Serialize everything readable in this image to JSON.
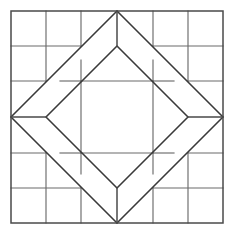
{
  "figure": {
    "type": "geometric-line-diagram",
    "caption": "",
    "background_color": "#ffffff",
    "line_color": "#3a3a3a",
    "grid_color": "#6b6b6b",
    "canvas": {
      "width": 237,
      "height": 235
    }
  },
  "geometry": {
    "outer_square": {
      "name": "outer-border-square",
      "x0": 11,
      "y0": 11,
      "x1": 223,
      "y1": 223
    },
    "grid": {
      "name": "six-by-six-grid",
      "columns": 6,
      "rows": 6,
      "x_positions": [
        11,
        46,
        81,
        117,
        153,
        188,
        223
      ],
      "y_positions": [
        11,
        46,
        81,
        117,
        153,
        188,
        223
      ]
    },
    "outer_diamond": {
      "name": "large-star-diamond",
      "points": [
        [
          117,
          11
        ],
        [
          223,
          117
        ],
        [
          117,
          223
        ],
        [
          11,
          117
        ]
      ]
    },
    "inner_diamond": {
      "name": "inner-diamond",
      "points": [
        [
          117,
          46
        ],
        [
          188,
          117
        ],
        [
          117,
          188
        ],
        [
          46,
          117
        ]
      ]
    },
    "center_square": {
      "name": "center-square-patch",
      "x0": 81,
      "y0": 81,
      "x1": 153,
      "y1": 153
    },
    "stems": [
      {
        "name": "stem-top",
        "from": [
          117,
          11
        ],
        "to": [
          117,
          46
        ]
      },
      {
        "name": "stem-left",
        "from": [
          11,
          117
        ],
        "to": [
          46,
          117
        ]
      },
      {
        "name": "stem-right",
        "from": [
          223,
          117
        ],
        "to": [
          188,
          117
        ]
      },
      {
        "name": "stem-bottom",
        "from": [
          117,
          223
        ],
        "to": [
          117,
          188
        ]
      }
    ],
    "corner_diagonals": [
      {
        "name": "diagonal-top-left",
        "from": [
          11,
          117
        ],
        "to": [
          117,
          11
        ]
      },
      {
        "name": "diagonal-top-right",
        "from": [
          117,
          11
        ],
        "to": [
          223,
          117
        ]
      },
      {
        "name": "diagonal-bottom-right",
        "from": [
          223,
          117
        ],
        "to": [
          117,
          223
        ]
      },
      {
        "name": "diagonal-bottom-left",
        "from": [
          117,
          223
        ],
        "to": [
          11,
          117
        ]
      }
    ],
    "inner_diagonals": [
      {
        "name": "inner-diagonal-top-left",
        "from": [
          46,
          117
        ],
        "to": [
          117,
          46
        ]
      },
      {
        "name": "inner-diagonal-top-right",
        "from": [
          117,
          46
        ],
        "to": [
          188,
          117
        ]
      },
      {
        "name": "inner-diagonal-bottom-right",
        "from": [
          188,
          117
        ],
        "to": [
          117,
          188
        ]
      },
      {
        "name": "inner-diagonal-bottom-left",
        "from": [
          117,
          188
        ],
        "to": [
          46,
          117
        ]
      }
    ]
  },
  "labels": {
    "none": ""
  }
}
